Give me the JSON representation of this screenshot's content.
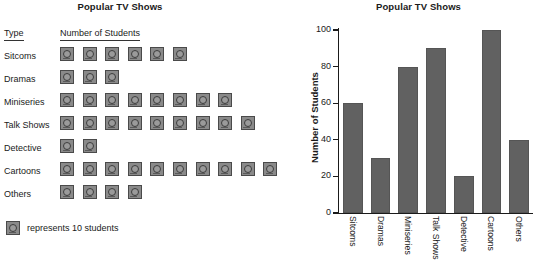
{
  "pictograph": {
    "title": "Popular TV Shows",
    "columns": {
      "type": "Type",
      "count": "Number of Students"
    },
    "icon_name": "tv-icon",
    "rows": [
      {
        "label": "Sitcoms",
        "icons": 6,
        "value": 60
      },
      {
        "label": "Dramas",
        "icons": 3,
        "value": 30
      },
      {
        "label": "Miniseries",
        "icons": 8,
        "value": 80
      },
      {
        "label": "Talk Shows",
        "icons": 9,
        "value": 90
      },
      {
        "label": "Detective",
        "icons": 2,
        "value": 20
      },
      {
        "label": "Cartoons",
        "icons": 10,
        "value": 100
      },
      {
        "label": "Others",
        "icons": 4,
        "value": 40
      }
    ],
    "legend": {
      "text": "represents 10 students",
      "icon_value": 10
    }
  },
  "chart_data": {
    "type": "bar",
    "title": "Popular TV Shows",
    "xlabel": "",
    "ylabel": "Number of Students",
    "categories": [
      "Sitcoms",
      "Dramas",
      "Miniseries",
      "Talk Shows",
      "Detective",
      "Cartoons",
      "Others"
    ],
    "values": [
      60,
      30,
      80,
      90,
      20,
      100,
      40
    ],
    "ylim": [
      0,
      100
    ],
    "yticks": [
      0,
      20,
      40,
      60,
      80,
      100
    ],
    "ytick_labels": [
      "0",
      "20",
      "40",
      "60",
      "80",
      "100"
    ],
    "grid": false,
    "legend": "none",
    "bar_color": "#616161",
    "axis_color": "#1a1a1a"
  },
  "colors": {
    "background": "#ffffff",
    "text": "#1a1a1a",
    "icon_fill": "#8a8a8a",
    "icon_border": "#4a4a4a",
    "bar_fill": "#616161"
  }
}
